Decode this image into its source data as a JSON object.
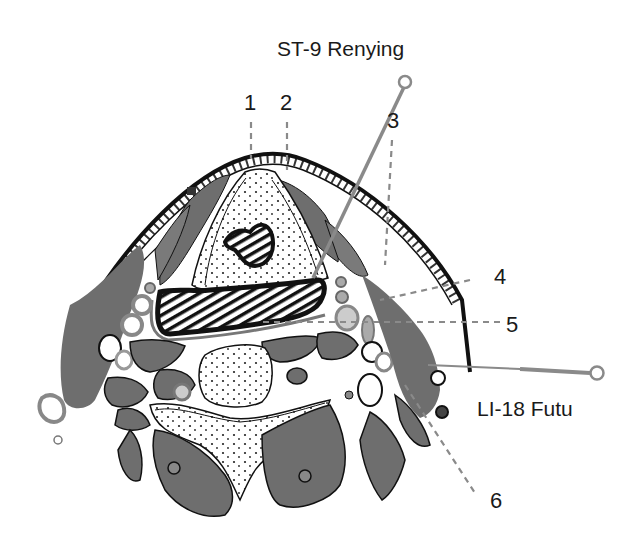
{
  "diagram": {
    "type": "anatomical cross-section",
    "colors": {
      "muscle": "#6e6e6e",
      "outline": "#111111",
      "skin_band": "#ffffff",
      "needle": "#8a8a8a",
      "leader_line": "#8a8a8a",
      "background": "#ffffff"
    },
    "acupoints": [
      {
        "id": "st9",
        "label": "ST-9 Renying"
      },
      {
        "id": "li18",
        "label": "LI-18 Futu"
      }
    ],
    "numbered_labels": [
      {
        "id": "n1",
        "text": "1"
      },
      {
        "id": "n2",
        "text": "2"
      },
      {
        "id": "n3",
        "text": "3"
      },
      {
        "id": "n4",
        "text": "4"
      },
      {
        "id": "n5",
        "text": "5"
      },
      {
        "id": "n6",
        "text": "6"
      }
    ]
  }
}
